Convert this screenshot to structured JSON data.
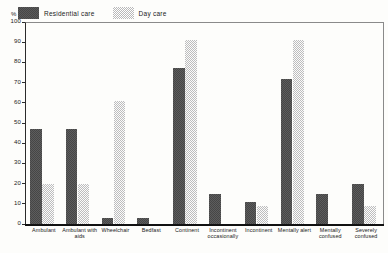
{
  "axis": {
    "unit_label": "%",
    "yticks": [
      0,
      10,
      20,
      30,
      40,
      50,
      60,
      70,
      80,
      90,
      100
    ]
  },
  "legend": {
    "items": [
      {
        "label": "Residential care",
        "swatch": "dark-checker-swatch",
        "color": "#5a5a5a"
      },
      {
        "label": "Day care",
        "swatch": "light-checker-swatch",
        "color": "#b9b9b9"
      }
    ]
  },
  "chart_data": {
    "type": "bar",
    "title": "",
    "xlabel": "",
    "ylabel": "%",
    "ylim": [
      0,
      100
    ],
    "grid": false,
    "legend_position": "top-left",
    "categories": [
      "Ambulant",
      "Ambulant with aids",
      "Wheelchair",
      "Bedfast",
      "Continent",
      "Incontinent occasionally",
      "Incontinent",
      "Mentally alert",
      "Mentally confused",
      "Severely confused"
    ],
    "series": [
      {
        "name": "Residential care",
        "color": "#5a5a5a",
        "values": [
          47,
          47,
          3,
          3,
          77,
          15,
          11,
          72,
          15,
          20
        ]
      },
      {
        "name": "Day care",
        "color": "#b9b9b9",
        "values": [
          20,
          20,
          61,
          0,
          91,
          0,
          9,
          91,
          0,
          9
        ]
      }
    ]
  }
}
